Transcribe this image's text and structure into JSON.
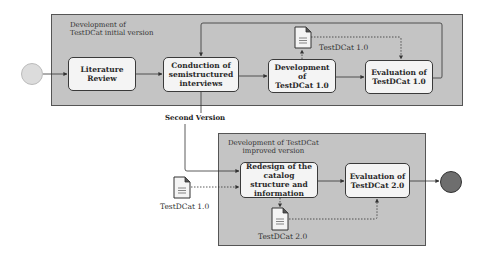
{
  "diagram": {
    "containers": [
      {
        "id": "initial",
        "label_line1": "Development of",
        "label_line2": "TestDCat initial version"
      },
      {
        "id": "improved",
        "label_line1": "Development of TestDCat",
        "label_line2": "improved version"
      }
    ],
    "tasks": {
      "literature_review": {
        "line1": "Literature Review",
        "line2": "",
        "line3": ""
      },
      "conduction": {
        "line1": "Conduction of",
        "line2": "semistructured",
        "line3": "interviews"
      },
      "development_1": {
        "line1": "Development of",
        "line2": "TestDCat 1.0"
      },
      "evaluation_1": {
        "line1": "Evaluation of",
        "line2": "TestDCat 1.0"
      },
      "redesign": {
        "line1": "Redesign of the",
        "line2": "catalog structure and",
        "line3": "information"
      },
      "evaluation_2": {
        "line1": "Evaluation of",
        "line2": "TestDCat 2.0"
      }
    },
    "data_objects": {
      "top_doc": "TestDCat 1.0",
      "left_doc": "TestDCat 1.0",
      "bottom_doc": "TestDCat 2.0"
    },
    "flow_labels": {
      "second_version": "Second Version"
    },
    "events": {
      "start": {
        "type": "start",
        "color": "#dcdcdc"
      },
      "end": {
        "type": "end",
        "color": "#6e6e6e"
      }
    },
    "colors": {
      "container_fill": "#c4c4c4",
      "task_fill": "#f4f4f4",
      "stroke": "#3a3a3a"
    }
  }
}
